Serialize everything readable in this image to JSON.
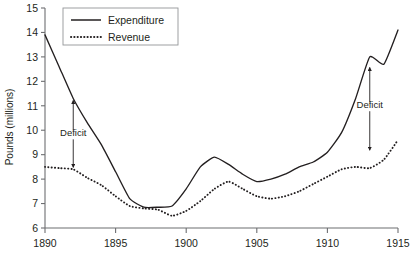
{
  "chart_data": {
    "type": "line",
    "title": "",
    "xlabel": "",
    "ylabel": "Pounds (millions)",
    "xlim": [
      1890,
      1915
    ],
    "ylim": [
      6,
      15
    ],
    "xticks": [
      1890,
      1895,
      1900,
      1905,
      1910,
      1915
    ],
    "yticks": [
      6,
      7,
      8,
      9,
      10,
      11,
      12,
      13,
      14,
      15
    ],
    "grid": false,
    "legend_position": "top-left",
    "x": [
      1890,
      1891,
      1892,
      1893,
      1894,
      1895,
      1896,
      1897,
      1898,
      1899,
      1900,
      1901,
      1902,
      1903,
      1904,
      1905,
      1906,
      1907,
      1908,
      1909,
      1910,
      1911,
      1912,
      1913,
      1914,
      1915
    ],
    "series": [
      {
        "name": "Expenditure",
        "style": "solid",
        "values": [
          13.9,
          12.6,
          11.3,
          10.3,
          9.4,
          8.3,
          7.2,
          6.85,
          6.85,
          6.9,
          7.6,
          8.5,
          8.9,
          8.6,
          8.2,
          7.9,
          8.0,
          8.2,
          8.5,
          8.7,
          9.1,
          9.9,
          11.3,
          13.0,
          12.7,
          14.1
        ]
      },
      {
        "name": "Revenue",
        "style": "dotted",
        "values": [
          8.5,
          8.45,
          8.4,
          8.05,
          7.75,
          7.3,
          6.9,
          6.8,
          6.75,
          6.5,
          6.7,
          7.1,
          7.6,
          7.9,
          7.6,
          7.3,
          7.2,
          7.3,
          7.5,
          7.8,
          8.1,
          8.4,
          8.5,
          8.45,
          8.8,
          9.6
        ]
      }
    ],
    "annotations": [
      {
        "label": "Deficit",
        "x": 1892,
        "top_value": 11.3,
        "bottom_value": 8.4,
        "label_value": 9.75
      },
      {
        "label": "Deficit",
        "x": 1913,
        "top_value": 12.65,
        "bottom_value": 9.1,
        "label_value": 10.9
      }
    ],
    "legend": [
      {
        "label": "Expenditure",
        "style": "solid"
      },
      {
        "label": "Revenue",
        "style": "dotted"
      }
    ]
  },
  "colors": {
    "line": "#231f20",
    "axis": "#6d6e71",
    "legend_border": "#939598",
    "background": "#ffffff"
  }
}
